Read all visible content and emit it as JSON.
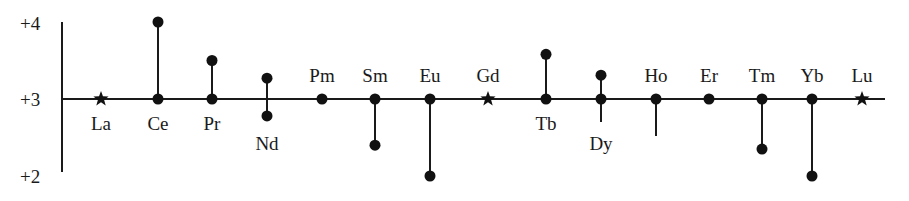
{
  "diagram": {
    "title": "",
    "y_axis": {
      "ticks": [
        {
          "label": "+4",
          "value": 4
        },
        {
          "label": "+3",
          "value": 3
        },
        {
          "label": "+2",
          "value": 2
        }
      ]
    },
    "elements": [
      {
        "symbol": "La",
        "x": 101,
        "marker": "star",
        "label_pos": "below",
        "up": null,
        "down": null,
        "base_dot": false
      },
      {
        "symbol": "Ce",
        "x": 158,
        "marker": "dot",
        "label_pos": "below",
        "up": 4.0,
        "up_dot": true,
        "down": null,
        "base_dot": true
      },
      {
        "symbol": "Pr",
        "x": 212,
        "marker": "dot",
        "label_pos": "below",
        "up": 3.5,
        "up_dot": true,
        "down": null,
        "base_dot": true
      },
      {
        "symbol": "Nd",
        "x": 267,
        "marker": "none",
        "label_pos": "below",
        "up": 3.27,
        "up_dot": true,
        "down": 2.78,
        "down_dot": true,
        "base_dot": false
      },
      {
        "symbol": "Pm",
        "x": 322,
        "marker": "dot",
        "label_pos": "above",
        "up": null,
        "down": null,
        "base_dot": true
      },
      {
        "symbol": "Sm",
        "x": 375,
        "marker": "dot",
        "label_pos": "above",
        "up": null,
        "down": 2.4,
        "down_dot": true,
        "base_dot": true
      },
      {
        "symbol": "Eu",
        "x": 430,
        "marker": "dot",
        "label_pos": "above",
        "up": null,
        "down": 2.0,
        "down_dot": true,
        "base_dot": true
      },
      {
        "symbol": "Gd",
        "x": 488,
        "marker": "star",
        "label_pos": "above",
        "up": null,
        "down": null,
        "base_dot": false
      },
      {
        "symbol": "Tb",
        "x": 546,
        "marker": "dot",
        "label_pos": "below",
        "up": 3.58,
        "up_dot": true,
        "down": null,
        "base_dot": true
      },
      {
        "symbol": "Dy",
        "x": 601,
        "marker": "dot",
        "label_pos": "below",
        "up": 3.31,
        "up_dot": true,
        "down": 2.7,
        "down_dot": false,
        "base_dot": true
      },
      {
        "symbol": "Ho",
        "x": 656,
        "marker": "dot",
        "label_pos": "above",
        "up": null,
        "down": 2.52,
        "down_dot": false,
        "base_dot": true
      },
      {
        "symbol": "Er",
        "x": 709,
        "marker": "dot",
        "label_pos": "above",
        "up": null,
        "down": null,
        "base_dot": true
      },
      {
        "symbol": "Tm",
        "x": 762,
        "marker": "dot",
        "label_pos": "above",
        "up": null,
        "down": 2.35,
        "down_dot": true,
        "base_dot": true
      },
      {
        "symbol": "Yb",
        "x": 812,
        "marker": "dot",
        "label_pos": "above",
        "up": null,
        "down": 2.0,
        "down_dot": true,
        "base_dot": true
      },
      {
        "symbol": "Lu",
        "x": 862,
        "marker": "star",
        "label_pos": "above",
        "up": null,
        "down": null,
        "base_dot": false
      }
    ]
  }
}
